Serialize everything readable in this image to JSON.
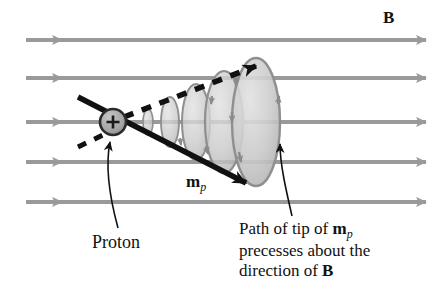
{
  "figure": {
    "background_color": "#ffffff",
    "width": 442,
    "height": 296
  },
  "labels": {
    "field_label": "B",
    "moment_label_main": "m",
    "moment_label_sub": "p",
    "proton_label": "Proton",
    "caption_line1_pre": "Path of tip of ",
    "caption_line1_vec": "m",
    "caption_line1_sub": "p",
    "caption_line2": "precesses about the",
    "caption_line3_pre": "direction of ",
    "caption_line3_vec": "B"
  },
  "colors": {
    "field_line": "#9a9a9a",
    "cone_fill": "#c9c9c9",
    "cone_edge": "#8f8f8f",
    "proton_fill": "#a8a8a8",
    "proton_stroke": "#2b2b2b",
    "vector_black": "#111111",
    "text": "#111111"
  },
  "diagram_data": {
    "type": "vector-diagram",
    "field_lines": [
      {
        "name": "field-line-1",
        "y": 40,
        "x_start": 26,
        "x_end": 426
      },
      {
        "name": "field-line-2",
        "y": 78,
        "x_start": 26,
        "x_end": 426
      },
      {
        "name": "field-line-3",
        "y": 122,
        "x_start": 26,
        "x_end": 426
      },
      {
        "name": "field-line-4",
        "y": 162,
        "x_start": 26,
        "x_end": 426
      },
      {
        "name": "field-line-5",
        "y": 202,
        "x_start": 26,
        "x_end": 426
      }
    ],
    "proton": {
      "cx": 113,
      "cy": 122,
      "r": 13,
      "charge_symbol": "+"
    },
    "moment_vector": {
      "x1": 78,
      "y1": 97,
      "x2": 252,
      "y2": 186,
      "style": "solid"
    },
    "precession_path_vector": {
      "x1": 78,
      "y1": 147,
      "x2": 264,
      "y2": 62,
      "style": "dashed"
    },
    "precession_cones": [
      {
        "cx": 148,
        "cy": 122,
        "rx": 5,
        "ry": 13
      },
      {
        "cx": 170,
        "cy": 122,
        "rx": 9,
        "ry": 25
      },
      {
        "cx": 196,
        "cy": 122,
        "rx": 14,
        "ry": 38
      },
      {
        "cx": 224,
        "cy": 122,
        "rx": 19,
        "ry": 51
      },
      {
        "cx": 256,
        "cy": 122,
        "rx": 24,
        "ry": 64
      }
    ],
    "leader_proton": {
      "from_x": 118,
      "from_y": 227,
      "to_x": 113,
      "to_y": 139
    },
    "leader_caption": {
      "from_x": 292,
      "from_y": 214,
      "to_x": 276,
      "to_y": 138
    }
  }
}
